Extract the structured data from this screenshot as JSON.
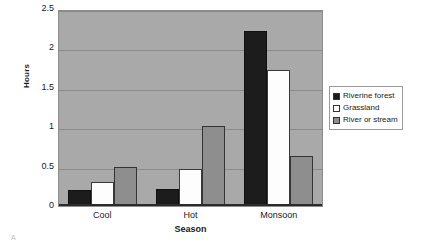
{
  "chart_data": {
    "type": "bar",
    "title": "",
    "xlabel": "Season",
    "ylabel": "Hours",
    "categories": [
      "Cool",
      "Hot",
      "Monsoon"
    ],
    "series": [
      {
        "name": "Riverine forest",
        "color": "#1c1c1c",
        "values": [
          0.2,
          0.21,
          2.22
        ]
      },
      {
        "name": "Grassland",
        "color": "#ffffff",
        "values": [
          0.3,
          0.47,
          1.73
        ]
      },
      {
        "name": "River or stream",
        "color": "#8e8e8e",
        "values": [
          0.49,
          1.02,
          0.64
        ]
      }
    ],
    "ylim": [
      0,
      2.5
    ],
    "yticks": [
      "2.5",
      "2",
      "1.5",
      "1",
      "0.5",
      "0"
    ],
    "ytick_values": [
      2.5,
      2,
      1.5,
      1,
      0.5,
      0
    ],
    "grid": true,
    "legend_position": "right",
    "plot_background": "#a9a9a9"
  },
  "figure": {
    "panel_letter": "A"
  }
}
